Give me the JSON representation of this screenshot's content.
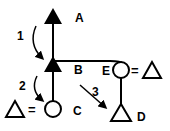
{
  "diagram": {
    "type": "pedigree-transition",
    "nodes": {
      "A": {
        "label": "A",
        "shape": "filled-triangle"
      },
      "B": {
        "label": "B",
        "shape": "filled-triangle"
      },
      "C": {
        "label": "C",
        "shape": "open-circle",
        "partner": "open-triangle"
      },
      "D": {
        "label": "D",
        "shape": "open-triangle"
      },
      "E": {
        "label": "E",
        "shape": "open-circle",
        "partner": "open-triangle"
      }
    },
    "arrows": [
      {
        "label": "1",
        "from": "A",
        "to": "B"
      },
      {
        "label": "2",
        "from": "B",
        "to": "C"
      },
      {
        "label": "3",
        "from": "B",
        "to": "D"
      }
    ],
    "equals_sign": "="
  }
}
